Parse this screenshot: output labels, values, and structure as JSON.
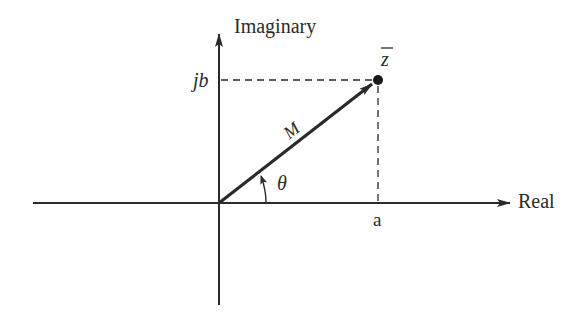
{
  "diagram": {
    "axes": {
      "vertical_label": "Imaginary",
      "horizontal_label": "Real"
    },
    "point": {
      "label": "z",
      "overbar": true,
      "imag_label": "jb",
      "real_label": "a"
    },
    "vector": {
      "magnitude_label": "M",
      "angle_label": "θ"
    },
    "colors": {
      "ink": "#2a2a2a",
      "background": "#ffffff"
    }
  }
}
